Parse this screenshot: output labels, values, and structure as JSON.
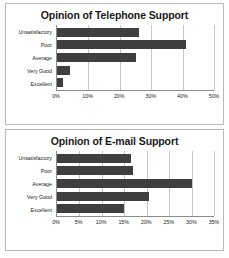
{
  "chart_data": [
    {
      "type": "bar",
      "orientation": "horizontal",
      "title": "Opinion of Telephone Support",
      "xlabel": "",
      "ylabel": "",
      "categories": [
        "Unsatisfactory",
        "Poor",
        "Average",
        "Very Good",
        "Excellent"
      ],
      "values": [
        26,
        41,
        25,
        4,
        2
      ],
      "xlim": [
        0,
        50
      ],
      "xticks": [
        0,
        10,
        20,
        30,
        40,
        50
      ],
      "xtick_labels": [
        "0%",
        "10%",
        "20%",
        "30%",
        "40%",
        "50%"
      ],
      "grid": true,
      "legend": false,
      "bar_color": "#3f3f3f"
    },
    {
      "type": "bar",
      "orientation": "horizontal",
      "title": "Opinion of E-mail Support",
      "xlabel": "",
      "ylabel": "",
      "categories": [
        "Unsatisfactory",
        "Poor",
        "Average",
        "Very Good",
        "Excellent"
      ],
      "values": [
        16.5,
        17,
        30,
        20.5,
        15
      ],
      "xlim": [
        0,
        35
      ],
      "xticks": [
        0,
        5,
        10,
        15,
        20,
        25,
        30,
        35
      ],
      "xtick_labels": [
        "0%",
        "5%",
        "10%",
        "15%",
        "20%",
        "25%",
        "30%",
        "35%"
      ],
      "grid": true,
      "legend": false,
      "bar_color": "#3f3f3f"
    }
  ]
}
